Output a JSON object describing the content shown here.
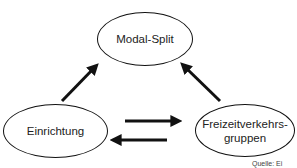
{
  "diagram": {
    "nodes": [
      {
        "id": "modal-split",
        "label": "Modal-Split"
      },
      {
        "id": "einrichtung",
        "label": "Einrichtung"
      },
      {
        "id": "freizeitverkehrsgruppen",
        "label": "Freizeitverkehrs-\ngruppen"
      }
    ],
    "edges": [
      {
        "from": "einrichtung",
        "to": "modal-split"
      },
      {
        "from": "freizeitverkehrsgruppen",
        "to": "modal-split"
      },
      {
        "from": "einrichtung",
        "to": "freizeitverkehrsgruppen"
      },
      {
        "from": "freizeitverkehrsgruppen",
        "to": "einrichtung"
      }
    ],
    "source_note": "Quelle: Ei",
    "colors": {
      "stroke": "#111111",
      "text": "#222222",
      "background": "#ffffff"
    }
  }
}
